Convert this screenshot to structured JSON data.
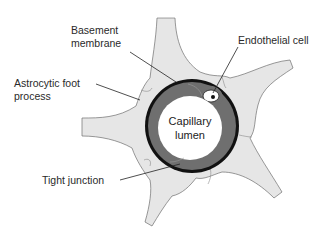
{
  "diagram": {
    "type": "anatomical cross-section",
    "colors": {
      "background": "#ffffff",
      "astrocyte_fill": "#e6e6e6",
      "astrocyte_stroke": "#6e6e6e",
      "endothelium_fill": "#6f6f6f",
      "basement_membrane": "#111111",
      "lumen_fill": "#ffffff",
      "leader_line": "#222222"
    }
  },
  "labels": {
    "basement_membrane": {
      "line1": "Basement",
      "line2": "membrane"
    },
    "endothelial_cell": "Endothelial cell",
    "astrocytic_foot_process": {
      "line1": "Astrocytic foot",
      "line2": "process"
    },
    "capillary_lumen": {
      "line1": "Capillary",
      "line2": "lumen"
    },
    "tight_junction": "Tight junction"
  }
}
